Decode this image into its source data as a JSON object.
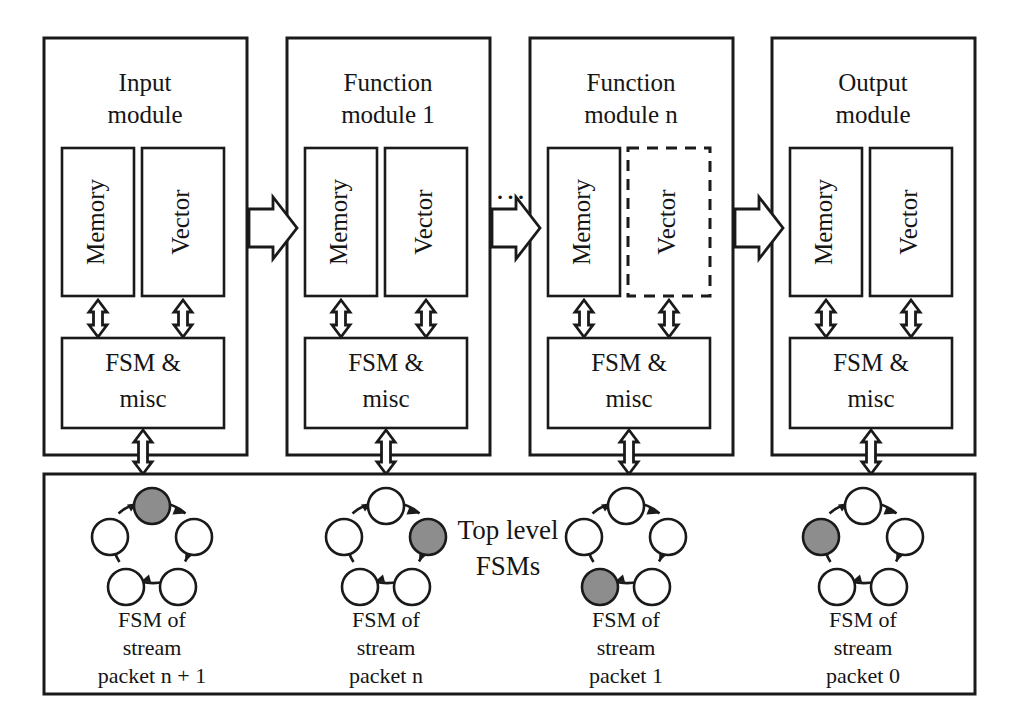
{
  "figure": {
    "colors": {
      "stroke": "#1a1a1a",
      "fill": "#ffffff",
      "active_state": "#8d8d8d"
    },
    "ellipsis": "..."
  },
  "modules": [
    {
      "id": "input-module",
      "title_line1": "Input",
      "title_line2": "module",
      "memory_label": "Memory",
      "vector_label": "Vector",
      "vector_dashed": false,
      "fsm_line1": "FSM &",
      "fsm_line2": "misc"
    },
    {
      "id": "function-module-1",
      "title_line1": "Function",
      "title_line2": "module 1",
      "memory_label": "Memory",
      "vector_label": "Vector",
      "vector_dashed": false,
      "fsm_line1": "FSM &",
      "fsm_line2": "misc"
    },
    {
      "id": "function-module-n",
      "title_line1": "Function",
      "title_line2": "module n",
      "memory_label": "Memory",
      "vector_label": "Vector",
      "vector_dashed": true,
      "fsm_line1": "FSM &",
      "fsm_line2": "misc"
    },
    {
      "id": "output-module",
      "title_line1": "Output",
      "title_line2": "module",
      "memory_label": "Memory",
      "vector_label": "Vector",
      "vector_dashed": false,
      "fsm_line1": "FSM &",
      "fsm_line2": "misc"
    }
  ],
  "top_level_panel": {
    "label_line1": "Top level",
    "label_line2": "FSMs",
    "fsms": [
      {
        "id": "fsm-stream-packet-n-plus-1",
        "caption_line1": "FSM of",
        "caption_line2": "stream",
        "caption_line3": "packet n + 1",
        "state_count": 5,
        "active_state_index": 0
      },
      {
        "id": "fsm-stream-packet-n",
        "caption_line1": "FSM of",
        "caption_line2": "stream",
        "caption_line3": "packet n",
        "state_count": 5,
        "active_state_index": 1
      },
      {
        "id": "fsm-stream-packet-1",
        "caption_line1": "FSM of",
        "caption_line2": "stream",
        "caption_line3": "packet 1",
        "state_count": 5,
        "active_state_index": 3
      },
      {
        "id": "fsm-stream-packet-0",
        "caption_line1": "FSM of",
        "caption_line2": "stream",
        "caption_line3": "packet 0",
        "state_count": 5,
        "active_state_index": 4
      }
    ]
  }
}
